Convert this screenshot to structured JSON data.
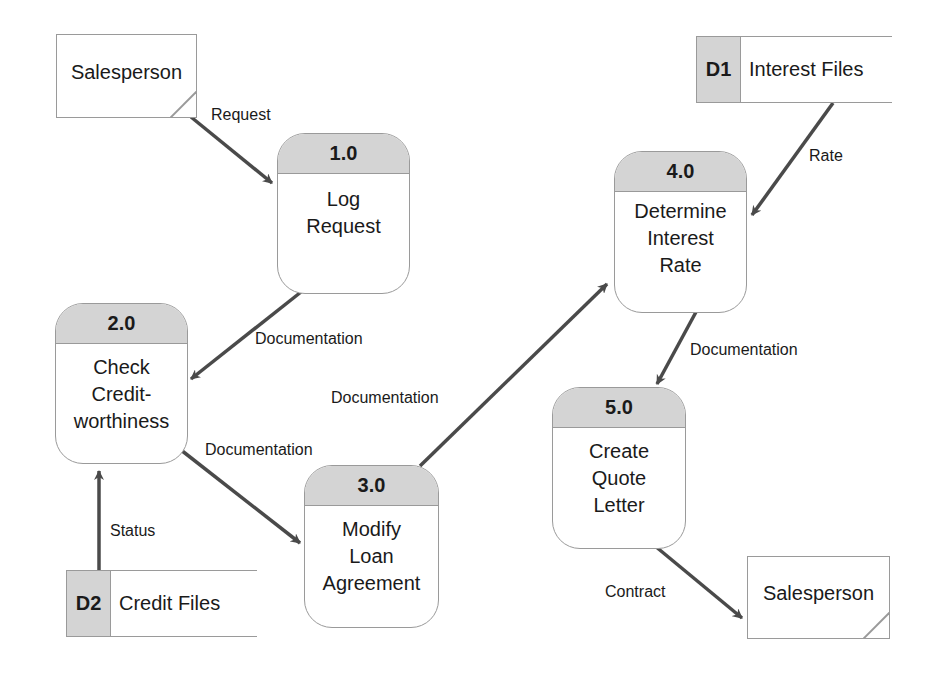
{
  "diagram": {
    "type": "data-flow-diagram",
    "colors": {
      "header_fill": "#d4d4d4",
      "border": "#9a9a9a",
      "arrow": "#4a4a4a"
    },
    "external_entities": [
      {
        "id": "salesperson-source",
        "label": "Salesperson"
      },
      {
        "id": "salesperson-sink",
        "label": "Salesperson"
      }
    ],
    "processes": [
      {
        "number": "1.0",
        "lines": [
          "Log",
          "Request"
        ]
      },
      {
        "number": "2.0",
        "lines": [
          "Check",
          "Credit-",
          "worthiness"
        ]
      },
      {
        "number": "3.0",
        "lines": [
          "Modify",
          "Loan",
          "Agreement"
        ]
      },
      {
        "number": "4.0",
        "lines": [
          "Determine",
          "Interest",
          "Rate"
        ]
      },
      {
        "number": "5.0",
        "lines": [
          "Create",
          "Quote",
          "Letter"
        ]
      }
    ],
    "data_stores": [
      {
        "id": "D1",
        "name": "Interest Files"
      },
      {
        "id": "D2",
        "name": "Credit Files"
      }
    ],
    "flows": [
      {
        "label": "Request",
        "from": "Salesperson",
        "to": "1.0"
      },
      {
        "label": "Documentation",
        "from": "1.0",
        "to": "2.0"
      },
      {
        "label": "Documentation",
        "from": "2.0",
        "to": "3.0"
      },
      {
        "label": "Documentation",
        "from": "3.0",
        "to": "4.0"
      },
      {
        "label": "Rate",
        "from": "D1",
        "to": "4.0"
      },
      {
        "label": "Documentation",
        "from": "4.0",
        "to": "5.0"
      },
      {
        "label": "Status",
        "from": "D2",
        "to": "2.0"
      },
      {
        "label": "Contract",
        "from": "5.0",
        "to": "Salesperson"
      }
    ]
  }
}
